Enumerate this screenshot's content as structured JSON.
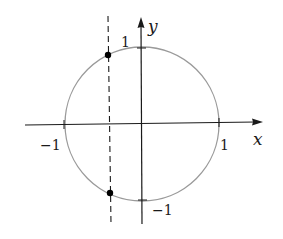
{
  "diagram": {
    "axes": {
      "x_label": "x",
      "y_label": "y",
      "x_tick_neg": "−1",
      "x_tick_pos": "1",
      "y_tick_pos": "1",
      "y_tick_neg": "−1"
    },
    "circle": {
      "center": [
        0,
        0
      ],
      "radius": 1,
      "stroke_color": "#9a9a9a"
    },
    "dashed_line": {
      "x_value": -0.42,
      "style": "dashed"
    },
    "points": [
      {
        "name": "upper-intersection",
        "x": -0.42,
        "y": 0.91
      },
      {
        "name": "lower-intersection",
        "x": -0.42,
        "y": -0.91
      }
    ],
    "colors": {
      "axis": "#1a1a1a",
      "circle": "#9a9a9a",
      "point": "#000000"
    }
  }
}
